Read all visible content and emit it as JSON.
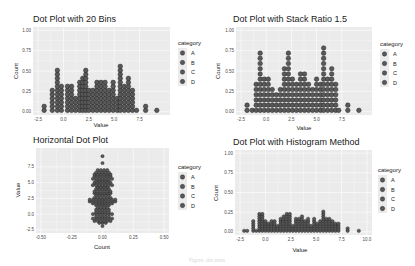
{
  "figure": {
    "caption": "Figure: dot plots"
  },
  "legend": {
    "title": "category",
    "items": [
      "A",
      "B",
      "C",
      "D"
    ]
  },
  "colors": {
    "panel_bg": "#ebebeb",
    "grid": "#ffffff",
    "dot_fill": "#595959",
    "dot_stroke": "#1a1a1a"
  },
  "chart_data": [
    {
      "type": "dotplot",
      "title": "Dot Plot with 20 Bins",
      "xlabel": "Value",
      "ylabel": "Count",
      "xlim": [
        -2.5,
        10
      ],
      "ylim": [
        0,
        1
      ],
      "xticks": [
        "-2.5",
        "0.0",
        "2.5",
        "5.0",
        "7.5"
      ],
      "yticks": [
        "0.00",
        "0.25",
        "0.50",
        "0.75",
        "1.00"
      ],
      "bins_x": [
        -1.9,
        -1.1,
        -0.6,
        -0.2,
        0.4,
        0.8,
        1.2,
        1.6,
        1.9,
        2.2,
        2.5,
        2.9,
        3.3,
        3.7,
        4.1,
        4.5,
        4.9,
        5.3,
        5.6,
        6.0,
        6.4,
        6.8,
        7.2,
        8.1,
        9.2
      ],
      "counts": [
        2,
        6,
        11,
        7,
        7,
        7,
        4,
        8,
        9,
        11,
        6,
        6,
        8,
        8,
        8,
        6,
        8,
        4,
        12,
        7,
        9,
        6,
        1,
        2,
        1
      ],
      "grid": true
    },
    {
      "type": "dotplot",
      "title": "Dot Plot with Stack Ratio 1.5",
      "xlabel": "Value",
      "ylabel": "Count",
      "xlim": [
        -2.5,
        10
      ],
      "ylim": [
        0,
        1
      ],
      "xticks": [
        "-2.5",
        "0.0",
        "2.5",
        "5.0",
        "7.5"
      ],
      "yticks": [
        "0.00",
        "0.25",
        "0.50",
        "0.75",
        "1.00"
      ],
      "stackratio": 1.5,
      "bins_x": [
        -1.9,
        -1.4,
        -1.0,
        -0.6,
        -0.2,
        0.2,
        0.6,
        1.0,
        1.4,
        1.8,
        2.2,
        2.6,
        3.0,
        3.4,
        3.8,
        4.2,
        4.6,
        5.0,
        5.4,
        5.7,
        6.1,
        6.5,
        6.9,
        7.2,
        8.1,
        9.2
      ],
      "counts": [
        2,
        1,
        6,
        12,
        7,
        7,
        5,
        4,
        5,
        9,
        12,
        7,
        6,
        8,
        8,
        6,
        5,
        7,
        6,
        13,
        7,
        9,
        6,
        1,
        2,
        1
      ],
      "grid": true
    },
    {
      "type": "dotplot",
      "title": "Horizontal Dot Plot",
      "xlabel": "Count",
      "ylabel": "Value",
      "xlim": [
        -0.5,
        0.5
      ],
      "ylim": [
        -2.5,
        10
      ],
      "xticks": [
        "-0.50",
        "-0.25",
        "0.00",
        "0.25",
        "0.50"
      ],
      "yticks": [
        "-2.5",
        "0.0",
        "2.5",
        "5.0",
        "7.5"
      ],
      "binaxis": "y",
      "stackdir": "center",
      "bins_y": [
        -1.9,
        -1.4,
        -1.1,
        -0.7,
        -0.4,
        0.0,
        0.3,
        0.7,
        1.0,
        1.4,
        1.7,
        2.0,
        2.3,
        2.6,
        3.0,
        3.3,
        3.6,
        4.0,
        4.3,
        4.6,
        5.0,
        5.3,
        5.6,
        6.0,
        6.3,
        6.6,
        7.0,
        8.1,
        9.2
      ],
      "counts": [
        1,
        3,
        6,
        7,
        5,
        7,
        5,
        5,
        4,
        5,
        7,
        9,
        9,
        6,
        5,
        6,
        6,
        5,
        4,
        7,
        6,
        5,
        7,
        6,
        6,
        5,
        4,
        1,
        1
      ],
      "grid": true
    },
    {
      "type": "dotplot",
      "title": "Dot Plot with Histogram Method",
      "xlabel": "Value",
      "ylabel": "Count",
      "xlim": [
        -2.5,
        10
      ],
      "ylim": [
        0,
        1
      ],
      "xticks": [
        "-2.5",
        "0.0",
        "2.5",
        "5.0",
        "7.5",
        "10.0"
      ],
      "yticks": [
        "0.00",
        "0.25",
        "0.50",
        "0.75",
        "1.00"
      ],
      "method": "histodot",
      "bins_x": [
        -2.1,
        -1.8,
        -1.2,
        -0.9,
        -0.6,
        -0.3,
        0.0,
        0.3,
        0.6,
        0.9,
        1.2,
        1.5,
        1.8,
        2.1,
        2.4,
        2.7,
        3.0,
        3.3,
        3.6,
        3.9,
        4.2,
        4.5,
        4.8,
        5.1,
        5.4,
        5.7,
        6.0,
        6.3,
        6.6,
        6.9,
        7.2,
        8.1,
        9.2
      ],
      "counts": [
        1,
        1,
        5,
        1,
        8,
        8,
        5,
        4,
        5,
        5,
        3,
        6,
        7,
        8,
        8,
        3,
        6,
        6,
        7,
        5,
        6,
        3,
        6,
        4,
        5,
        9,
        6,
        6,
        5,
        4,
        4,
        2,
        1
      ],
      "grid": true
    }
  ]
}
